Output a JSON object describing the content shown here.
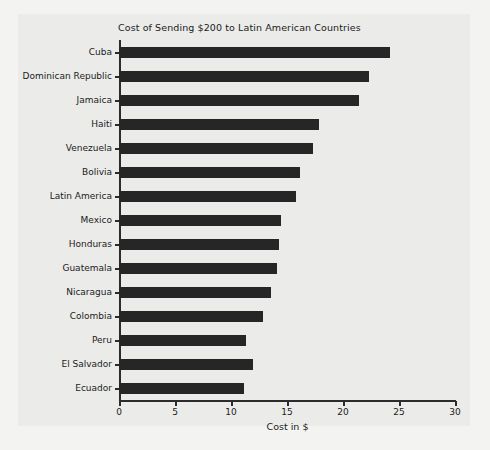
{
  "chart_data": {
    "type": "bar",
    "orientation": "horizontal",
    "title": "Cost of Sending $200 to Latin American Countries",
    "xlabel": "Cost in $",
    "ylabel": "",
    "xlim": [
      0,
      30
    ],
    "xticks": [
      0,
      5,
      10,
      15,
      20,
      25,
      30
    ],
    "xtick_labels": [
      "0",
      "5",
      "10",
      "15",
      "20",
      "25",
      "30"
    ],
    "grid": false,
    "legend": null,
    "categories": [
      "Cuba",
      "Dominican Republic",
      "Jamaica",
      "Haiti",
      "Venezuela",
      "Bolivia",
      "Latin America",
      "Mexico",
      "Honduras",
      "Guatemala",
      "Nicaragua",
      "Colombia",
      "Peru",
      "El Salvador",
      "Ecuador"
    ],
    "values": [
      24.2,
      22.3,
      21.4,
      17.9,
      17.3,
      16.2,
      15.8,
      14.5,
      14.3,
      14.1,
      13.6,
      12.9,
      11.3,
      12.0,
      11.2
    ],
    "bar_color": "#262626",
    "plot_background": "#ebebe9",
    "figure_background": "#f3f3f1",
    "axis_color": "#2b2b2b"
  }
}
